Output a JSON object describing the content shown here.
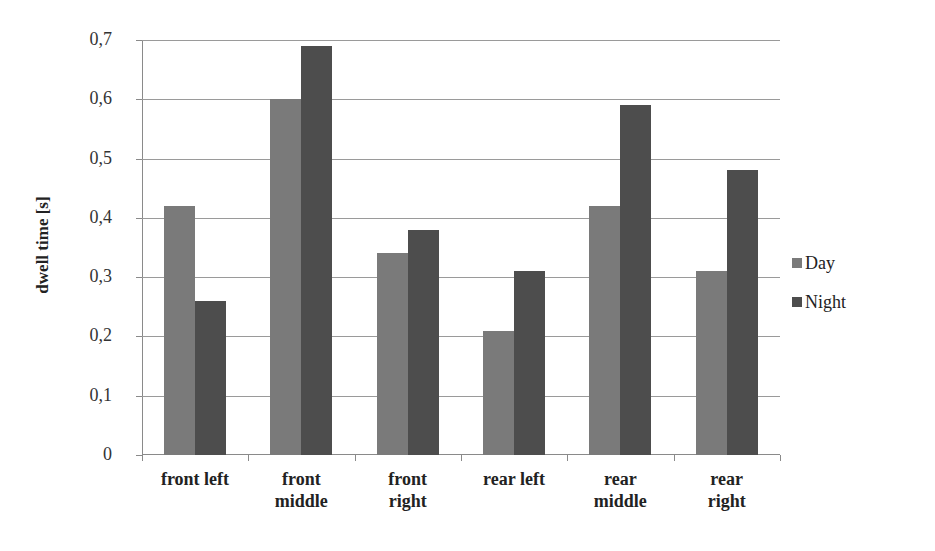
{
  "chart_data": {
    "type": "bar",
    "title": "",
    "xlabel": "",
    "ylabel": "dwell time [s]",
    "ylim": [
      0,
      0.7
    ],
    "yticks": [
      "0",
      "0,1",
      "0,2",
      "0,3",
      "0,4",
      "0,5",
      "0,6",
      "0,7"
    ],
    "grid": true,
    "legend_position": "right",
    "categories": [
      "front left",
      "front middle",
      "front right",
      "rear left",
      "rear middle",
      "rear right"
    ],
    "category_lines": [
      [
        "front left"
      ],
      [
        "front",
        "middle"
      ],
      [
        "front",
        "right"
      ],
      [
        "rear left"
      ],
      [
        "rear",
        "middle"
      ],
      [
        "rear",
        "right"
      ]
    ],
    "series": [
      {
        "name": "Day",
        "color": "#7a7a7a",
        "values": [
          0.42,
          0.6,
          0.34,
          0.21,
          0.42,
          0.31
        ]
      },
      {
        "name": "Night",
        "color": "#4d4d4d",
        "values": [
          0.26,
          0.69,
          0.38,
          0.31,
          0.59,
          0.48
        ]
      }
    ]
  }
}
